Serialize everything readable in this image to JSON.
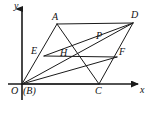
{
  "figure": {
    "type": "geometry-diagram",
    "width": 150,
    "height": 113,
    "stroke_color": "#1a1a1a",
    "background_color": "#ffffff",
    "axes": {
      "x_axis_label": "x",
      "y_axis_label": "y",
      "origin_label": "O",
      "origin_alias_label": "(B)"
    },
    "points": [
      {
        "id": "O",
        "label": "O",
        "x": 22,
        "y": 84,
        "label_x": 12,
        "label_y": 86
      },
      {
        "id": "B",
        "label": "(B)",
        "x": 22,
        "y": 84,
        "label_x": 24,
        "label_y": 86
      },
      {
        "id": "A",
        "label": "A",
        "x": 57,
        "y": 24,
        "label_x": 52,
        "label_y": 12
      },
      {
        "id": "D",
        "label": "D",
        "x": 133,
        "y": 23,
        "label_x": 131,
        "label_y": 11
      },
      {
        "id": "C",
        "label": "C",
        "x": 99,
        "y": 84,
        "label_x": 95,
        "label_y": 86
      },
      {
        "id": "E",
        "label": "E",
        "x": 44,
        "y": 56,
        "label_x": 32,
        "label_y": 47
      },
      {
        "id": "F",
        "label": "F",
        "x": 117,
        "y": 57,
        "label_x": 119,
        "label_y": 48
      },
      {
        "id": "P",
        "label": "P",
        "x": 100,
        "y": 44,
        "label_x": 96,
        "label_y": 32
      },
      {
        "id": "H",
        "label": "H",
        "x": 66,
        "y": 60,
        "label_x": 60,
        "label_y": 49
      }
    ],
    "segments": [
      {
        "id": "OA",
        "from": "O",
        "to": "A",
        "note": "left side of parallelogram"
      },
      {
        "id": "AD",
        "from": "A",
        "to": "D",
        "note": "top side of parallelogram"
      },
      {
        "id": "DC",
        "from": "D",
        "to": "C",
        "note": "right side of parallelogram"
      },
      {
        "id": "CO",
        "from": "C",
        "to": "O",
        "note": "bottom side on x-axis"
      },
      {
        "id": "OD",
        "from": "O",
        "to": "D",
        "note": "diagonal through H and P"
      },
      {
        "id": "AC",
        "from": "A",
        "to": "C",
        "note": "diagonal through H and P"
      },
      {
        "id": "EF",
        "from": "E",
        "to": "F",
        "note": "midline segment"
      },
      {
        "id": "ED",
        "from": "E",
        "to": "D",
        "note": "cevian to D through P"
      },
      {
        "id": "OF",
        "from": "O",
        "to": "F",
        "note": "cevian to F through H"
      }
    ],
    "axis_lines": {
      "x_axis": {
        "x1": 8,
        "y1": 84,
        "x2": 140,
        "y2": 84
      },
      "y_axis": {
        "x1": 22,
        "y1": 100,
        "x2": 22,
        "y2": 6
      },
      "x_label_pos": {
        "x": 140,
        "y": 86
      },
      "y_label_pos": {
        "x": 14,
        "y": 1
      }
    }
  }
}
